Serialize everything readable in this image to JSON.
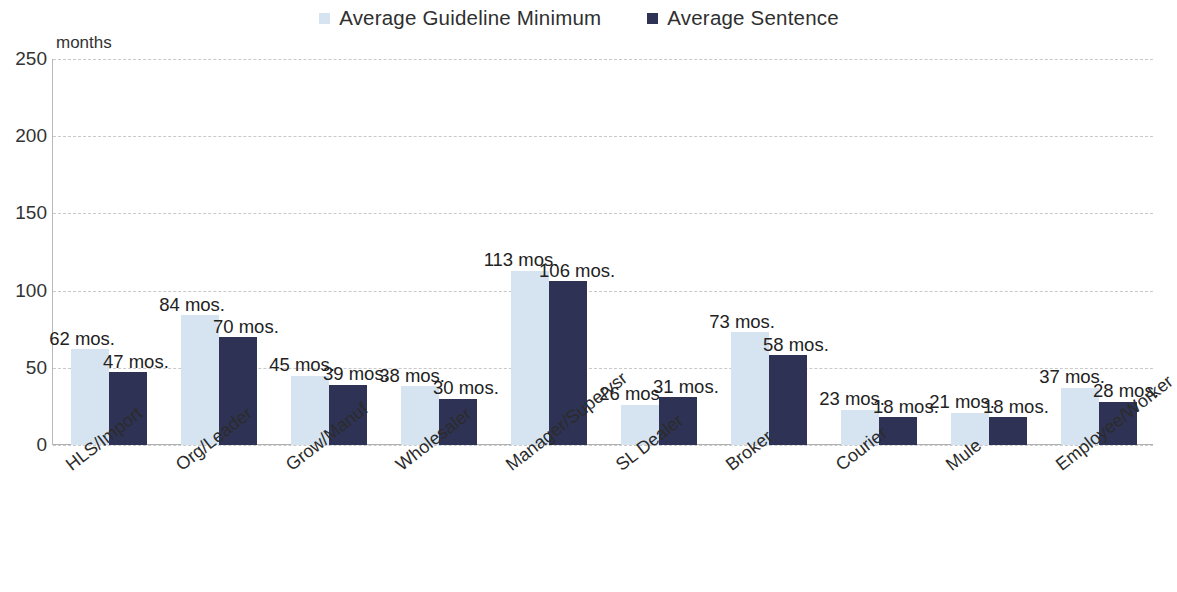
{
  "legend": {
    "items": [
      {
        "label": "Average Guideline Minimum",
        "color": "#d6e4f1",
        "marker": "square-swatch-light"
      },
      {
        "label": "Average Sentence",
        "color": "#2e3356",
        "marker": "square-swatch-dark"
      }
    ]
  },
  "axis": {
    "y_unit_label": "months",
    "y_ticks": [
      "0",
      "50",
      "100",
      "150",
      "200",
      "250"
    ]
  },
  "chart_data": {
    "type": "bar",
    "title": "",
    "subtitle": "",
    "xlabel": "",
    "ylabel": "months",
    "ylim": [
      0,
      250
    ],
    "ytick_values": [
      0,
      50,
      100,
      150,
      200,
      250
    ],
    "grid": "horizontal-dashed",
    "legend_position": "top-center",
    "value_suffix": " mos.",
    "categories": [
      "HLS/Import",
      "Org/Leader",
      "Grow/Manuf",
      "Wholesaler",
      "Manager/Supervsr",
      "SL Dealer",
      "Broker",
      "Courier",
      "Mule",
      "Employee/Worker"
    ],
    "series": [
      {
        "name": "Average Guideline Minimum",
        "color": "#d6e4f1",
        "values": [
          62,
          84,
          45,
          38,
          113,
          26,
          73,
          23,
          21,
          37
        ],
        "labels": [
          "62 mos.",
          "84 mos.",
          "45 mos.",
          "38 mos.",
          "113 mos.",
          "26 mos.",
          "73 mos.",
          "23 mos.",
          "21 mos.",
          "37 mos."
        ]
      },
      {
        "name": "Average Sentence",
        "color": "#2e3356",
        "values": [
          47,
          70,
          39,
          30,
          106,
          31,
          58,
          18,
          18,
          28
        ],
        "labels": [
          "47 mos.",
          "70 mos.",
          "39 mos.",
          "30 mos.",
          "106 mos.",
          "31 mos.",
          "58 mos.",
          "18 mos.",
          "18 mos.",
          "28 mos."
        ]
      }
    ]
  }
}
